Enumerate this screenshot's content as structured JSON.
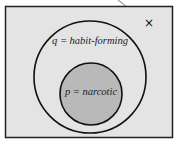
{
  "diagram": {
    "type": "venn",
    "universe": {
      "fill": "#e4e4e4",
      "stroke": "#222222"
    },
    "outer_set": {
      "label": "q = habit-forming",
      "variable": "q",
      "meaning": "habit-forming"
    },
    "inner_set": {
      "label": "p = narcotic",
      "variable": "p",
      "meaning": "narcotic",
      "fill": "#b9b9b9"
    },
    "marker": {
      "symbol": "×",
      "pointer_color": "#9a9a9a"
    }
  }
}
